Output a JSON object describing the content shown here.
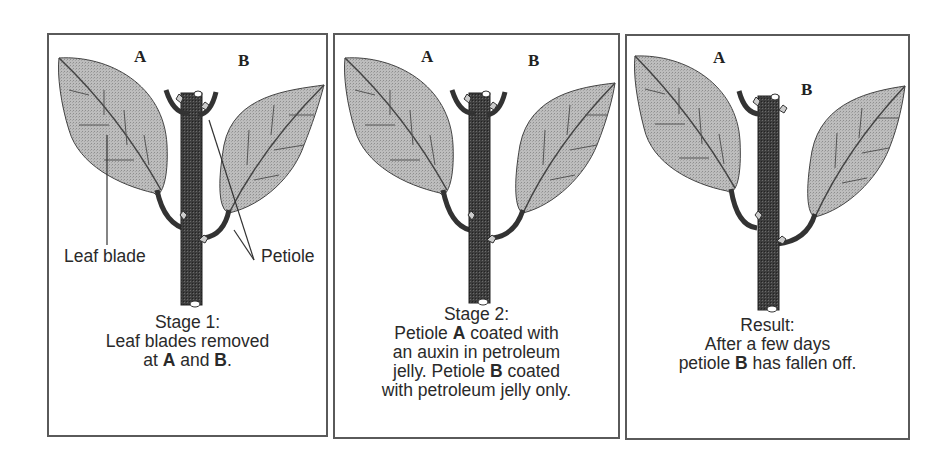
{
  "diagram": {
    "panels": [
      {
        "id": "stage1",
        "letter_a": "A",
        "letter_b": "B",
        "labels": {
          "leaf_blade": "Leaf blade",
          "petiole": "Petiole"
        },
        "caption": {
          "line1": "Stage 1:",
          "line2": "Leaf blades removed",
          "line3_pre": "at ",
          "line3_a": "A",
          "line3_mid": " and ",
          "line3_b": "B",
          "line3_post": "."
        }
      },
      {
        "id": "stage2",
        "letter_a": "A",
        "letter_b": "B",
        "caption": {
          "line1": "Stage 2:",
          "line2_pre": "Petiole ",
          "line2_a": "A",
          "line2_post": " coated with",
          "line3": "an auxin in petroleum",
          "line4_pre": "jelly. Petiole ",
          "line4_b": "B",
          "line4_post": " coated",
          "line5": "with petroleum jelly only."
        }
      },
      {
        "id": "result",
        "letter_a": "A",
        "letter_b": "B",
        "caption": {
          "line1": "Result:",
          "line2": "After a few days",
          "line3_pre": "petiole ",
          "line3_b": "B",
          "line3_post": " has fallen off."
        }
      }
    ],
    "colors": {
      "border": "#5a5a5a",
      "leaf_fill": "#b8b8b8",
      "stem_fill": "#3a3a3a",
      "text": "#2a2a2a"
    }
  }
}
